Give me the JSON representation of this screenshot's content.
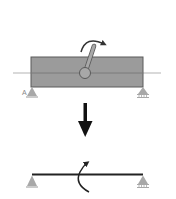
{
  "diagram": {
    "title": "",
    "top_panel": {
      "description": "Rigid block on simply supported beam with applied crank moment",
      "support_left_label": "A",
      "block_color": "#9b9b9b",
      "block_border": "#5a5a5a",
      "axis_color": "#aaaaaa",
      "crank_color": "#8c8c8c",
      "moment_arrow_color": "#333333",
      "moment_direction": "clockwise"
    },
    "transform_arrow": {
      "direction": "down",
      "color": "#111111"
    },
    "bottom_panel": {
      "description": "Equivalent simply supported beam with concentrated moment",
      "beam_color": "#222222",
      "moment_arrow_color": "#222222",
      "moment_direction": "counterclockwise",
      "left_support": "pin",
      "right_support": "roller"
    },
    "support_color": "#a8a8a8"
  }
}
